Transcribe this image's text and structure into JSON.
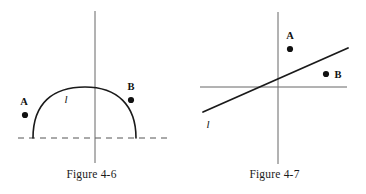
{
  "page": {
    "background_color": "#ffffff",
    "ink_color": "#1a1a1a"
  },
  "figures": [
    {
      "id": "figure-4-6",
      "caption": "Figure 4-6",
      "description": "Semicircular arc labeled l sitting on a dashed horizontal line, crossed by a vertical line; point A outside left of the arc, point B outside right of the arc.",
      "elements": {
        "arc_label": "l",
        "point_a_label": "A",
        "point_b_label": "B"
      },
      "geometry": {
        "dashed_line": {
          "x1": 18,
          "y1": 138,
          "x2": 168,
          "y2": 138
        },
        "vertical_line": {
          "x1": 95,
          "y1": 11,
          "x2": 95,
          "y2": 163
        },
        "arc": {
          "start_x": 33,
          "start_y": 138,
          "end_x": 136,
          "end_y": 138,
          "apex_x": 90,
          "apex_y": 88
        },
        "arc_label_pos": {
          "x": 66,
          "y": 101
        },
        "point_a": {
          "dot_x": 25,
          "dot_y": 115,
          "label_x": 24,
          "label_y": 104
        },
        "point_b": {
          "dot_x": 131,
          "dot_y": 100,
          "label_x": 131,
          "label_y": 89
        }
      }
    },
    {
      "id": "figure-4-7",
      "caption": "Figure 4-7",
      "description": "Coordinate axes with a straight line l of positive slope crossing them; point A above the line near the y-axis, point B below the line on the right.",
      "elements": {
        "line_label": "l",
        "point_a_label": "A",
        "point_b_label": "B"
      },
      "geometry": {
        "x_axis": {
          "x1": 200,
          "y1": 87,
          "x2": 347,
          "y2": 87
        },
        "y_axis": {
          "x1": 278,
          "y1": 12,
          "x2": 278,
          "y2": 164
        },
        "line": {
          "x1": 203,
          "y1": 112,
          "x2": 348,
          "y2": 48
        },
        "line_label_pos": {
          "x": 208,
          "y": 126
        },
        "point_a": {
          "dot_x": 290,
          "dot_y": 49,
          "label_x": 290,
          "label_y": 38
        },
        "point_b": {
          "dot_x": 326,
          "dot_y": 74,
          "label_x": 338,
          "label_y": 77
        }
      }
    }
  ]
}
